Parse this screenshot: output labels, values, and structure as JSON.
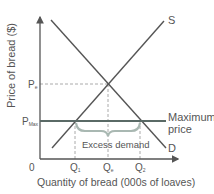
{
  "diagram": {
    "y_axis_label": "Price of bread ($)",
    "x_axis_label": "Quantity of bread (000s of loaves)",
    "origin_label": "0",
    "supply_label": "S",
    "demand_label": "D",
    "pe_label": "P",
    "pe_sub": "e",
    "pmax_label": "P",
    "pmax_sub": "Max",
    "q1_label": "Q",
    "q1_sub": "1",
    "qe_label": "Q",
    "qe_sub": "e",
    "q2_label": "Q",
    "q2_sub": "2",
    "max_price_line1": "Maximum",
    "max_price_line2": "price",
    "excess_demand_label": "Excess demand",
    "colors": {
      "lines": "#555555",
      "max_price_line": "#5a6a66",
      "dashed": "#aaaaaa",
      "brace": "#a9b8b2",
      "text": "#555555"
    }
  }
}
